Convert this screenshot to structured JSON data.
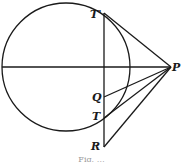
{
  "diagram": {
    "type": "geometry-figure",
    "colors": {
      "stroke": "#1a1a1a",
      "background": "#ffffff"
    },
    "circle": {
      "cx": 66,
      "cy": 67,
      "r": 64
    },
    "points": {
      "T_prime": {
        "label": "T'",
        "x": 104,
        "y": 13
      },
      "P": {
        "label": "P",
        "x": 171,
        "y": 67
      },
      "Q": {
        "label": "Q",
        "x": 104,
        "y": 97
      },
      "T": {
        "label": "T",
        "x": 104,
        "y": 118
      },
      "R": {
        "label": "R",
        "x": 104,
        "y": 147
      }
    },
    "segments": [
      {
        "from": "diameter-left",
        "to": "P"
      },
      {
        "from": "T_prime",
        "to": "R"
      },
      {
        "from": "T_prime",
        "to": "P"
      },
      {
        "from": "Q",
        "to": "P"
      },
      {
        "from": "T",
        "to": "P"
      },
      {
        "from": "R",
        "to": "P"
      }
    ],
    "labels": {
      "t_prime": "T'",
      "p": "P",
      "q": "Q",
      "t": "T",
      "r": "R"
    },
    "caption": "Fig. …"
  }
}
